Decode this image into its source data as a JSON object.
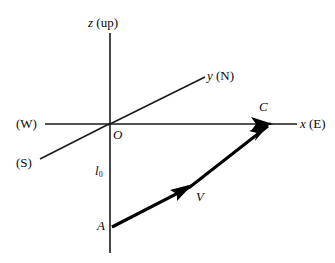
{
  "figure": {
    "background_color": "#ffffff",
    "line_color": "#1a1a1a",
    "vector_color": "#000000",
    "width": 335,
    "height": 263
  },
  "axes": {
    "z": {
      "name": "z-axis",
      "symbol": "z",
      "annotation": "(up)",
      "label": "z (up)",
      "from": [
        110,
        33
      ],
      "to": [
        110,
        253
      ]
    },
    "y": {
      "name": "y-axis",
      "symbol": "y",
      "annotation": "(N)",
      "label": "y (N)",
      "from": [
        108,
        124
      ],
      "to": [
        205,
        77
      ]
    },
    "y_negative": {
      "name": "y-negative-axis",
      "annotation": "(S)",
      "label": "(S)",
      "from": [
        40,
        158
      ],
      "to": [
        108,
        124
      ]
    },
    "x": {
      "name": "x-axis",
      "symbol": "x",
      "annotation": "(E)",
      "label": "x (E)",
      "from": [
        108,
        124
      ],
      "to": [
        297,
        124
      ],
      "arrow_at": [
        272,
        124
      ]
    },
    "x_negative": {
      "name": "x-negative-axis",
      "annotation": "(W)",
      "label": "(W)",
      "from": [
        45,
        124
      ],
      "to": [
        108,
        124
      ]
    }
  },
  "points": {
    "origin": {
      "label": "O",
      "at": [
        108,
        124
      ]
    },
    "a": {
      "label": "A",
      "at": [
        112,
        227
      ]
    },
    "c": {
      "label": "C",
      "at": [
        270,
        124
      ]
    }
  },
  "vector": {
    "label": "V",
    "name": "velocity-vector",
    "from": [
      112,
      227
    ],
    "bend": [
      190,
      187
    ],
    "to": [
      270,
      124
    ],
    "mid_arrow_at": [
      178,
      192
    ]
  },
  "segments": {
    "altitude": {
      "label": "l",
      "subscript": "0",
      "full_label": "l0"
    }
  }
}
